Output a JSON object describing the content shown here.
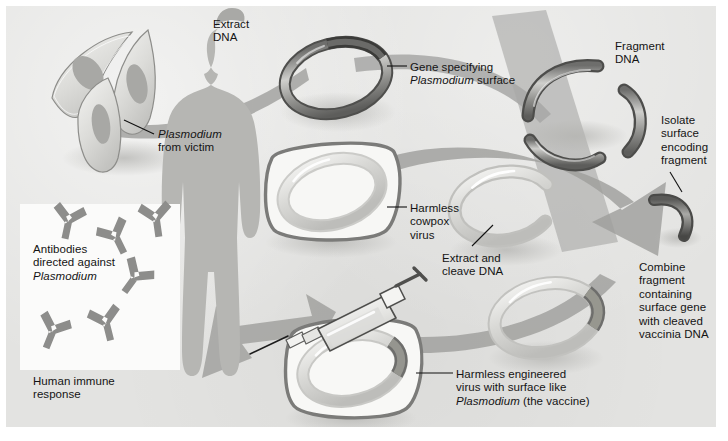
{
  "figure": {
    "background_color": "#e3e3e1",
    "ink_color": "#141414"
  },
  "palette": {
    "panel_bg": "#e3e3e1",
    "arrow_gray": "#9a9a99",
    "dna_dark": "#4a4a4a",
    "dna_mid": "#8a8a88",
    "dna_light": "#c9c9c6",
    "plasmid_pale": "#d2d2cf",
    "virus_outline": "#7e7e7c",
    "cell_outline": "#8d8d8a",
    "human_gray": "#b9b9b6",
    "antibody_gray": "#8e8e8c",
    "white_box": "#fbfbfa",
    "shadow": "#c2c2bf"
  },
  "labels": [
    {
      "id": "extract-dna",
      "text": "Extract\nDNA",
      "x": 207,
      "y": 12,
      "italic_words": []
    },
    {
      "id": "gene-specifying",
      "text": "Gene specifying\nPlasmodium surface",
      "x": 404,
      "y": 55,
      "italic_words": [
        "Plasmodium"
      ]
    },
    {
      "id": "fragment-dna",
      "text": "Fragment\nDNA",
      "x": 609,
      "y": 34,
      "italic_words": []
    },
    {
      "id": "plasmodium-victim",
      "text": "Plasmodium\nfrom victim",
      "x": 152,
      "y": 122,
      "italic_words": [
        "Plasmodium"
      ]
    },
    {
      "id": "isolate-fragment",
      "text": "Isolate\nsurface\nencoding\nfragment",
      "x": 655,
      "y": 108,
      "italic_words": []
    },
    {
      "id": "harmless-cowpox",
      "text": "Harmless\ncowpox\nvirus",
      "x": 404,
      "y": 196,
      "italic_words": []
    },
    {
      "id": "extract-cleave",
      "text": "Extract and\ncleave DNA",
      "x": 436,
      "y": 246,
      "italic_words": []
    },
    {
      "id": "combine-fragment",
      "text": "Combine\nfragment\ncontaining\nsurface gene\nwith cleaved\nvaccinia DNA",
      "x": 633,
      "y": 255,
      "italic_words": []
    },
    {
      "id": "antibodies",
      "text": "Antibodies\ndirected against\nPlasmodium",
      "x": 27,
      "y": 237,
      "italic_words": [
        "Plasmodium"
      ]
    },
    {
      "id": "human-immune",
      "text": "Human immune\nresponse",
      "x": 27,
      "y": 369,
      "italic_words": []
    },
    {
      "id": "harmless-engineered",
      "text": "Harmless engineered\nvirus with surface like\nPlasmodium (the vaccine)",
      "x": 450,
      "y": 362,
      "italic_words": [
        "Plasmodium"
      ]
    }
  ],
  "leaders": [
    {
      "id": "leader-plasmodium",
      "x1": 148,
      "y1": 128,
      "x2": 118,
      "y2": 114
    },
    {
      "id": "leader-gene",
      "x1": 401,
      "y1": 60,
      "x2": 381,
      "y2": 60
    },
    {
      "id": "leader-cowpox",
      "x1": 401,
      "y1": 201,
      "x2": 381,
      "y2": 201
    },
    {
      "id": "leader-isolate",
      "x1": 664,
      "y1": 166,
      "x2": 676,
      "y2": 186
    },
    {
      "id": "leader-cleave",
      "x1": 466,
      "y1": 240,
      "x2": 487,
      "y2": 219
    },
    {
      "id": "leader-engineered",
      "x1": 447,
      "y1": 367,
      "x2": 410,
      "y2": 367
    }
  ],
  "elements": [
    {
      "id": "plasmodium-cells",
      "name": "plasmodium-cell-cluster",
      "count": 3,
      "description": "crescent spindle-shaped parasite cells with nuclei"
    },
    {
      "id": "source-plasmid",
      "name": "plasmodium-dna-plasmid",
      "description": "circular DNA ring with dark gene segment"
    },
    {
      "id": "dna-fragments",
      "name": "dna-fragment-group",
      "count": 3,
      "description": "three cleaved curved DNA rod fragments"
    },
    {
      "id": "isolated-fragment",
      "name": "isolated-surface-gene-fragment",
      "description": "single curved dark DNA fragment"
    },
    {
      "id": "cowpox-virus",
      "name": "cowpox-virus-particle",
      "description": "rounded-square virus with internal circular DNA"
    },
    {
      "id": "cleaved-vaccinia-dna",
      "name": "cleaved-vaccinia-dna",
      "description": "open C-shaped linearized plasmid"
    },
    {
      "id": "recombinant-plasmid",
      "name": "recombinant-plasmid",
      "description": "closed ring with inserted dark surface-gene segment"
    },
    {
      "id": "engineered-virus",
      "name": "engineered-virus-particle",
      "description": "rounded-square virus with recombinant ring"
    },
    {
      "id": "syringe",
      "name": "vaccine-syringe",
      "description": "syringe injecting vaccine into human"
    },
    {
      "id": "human-figure",
      "name": "human-silhouette",
      "description": "gray standing human body silhouette"
    },
    {
      "id": "antibody-box",
      "name": "antibody-inset-box",
      "count": 6,
      "description": "white inset box containing Y-shaped antibodies"
    }
  ]
}
